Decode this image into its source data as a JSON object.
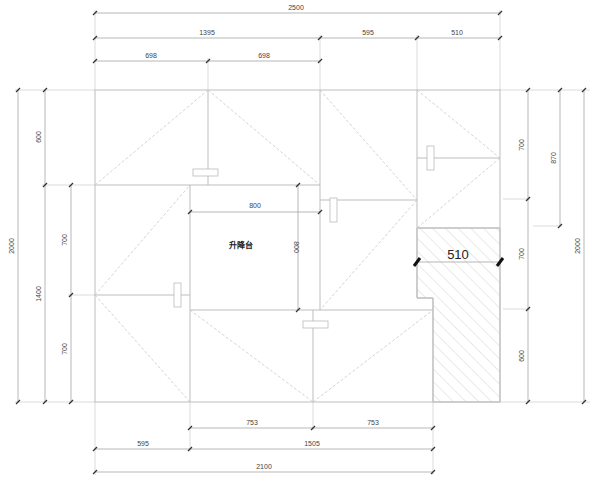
{
  "drawing": {
    "room_label": "升降台",
    "hatched_width_label": "510",
    "colors": {
      "line": "#bdbdbd",
      "dimension": "#9a9a9a",
      "text": "#444444",
      "hatch": "#c8c8c8"
    }
  },
  "dimensions": {
    "top": {
      "overall": "2500",
      "row2": [
        "1395",
        "595",
        "510"
      ],
      "row3": [
        "698",
        "698"
      ]
    },
    "left": {
      "overall": "2000",
      "row2": [
        "600",
        "1400"
      ],
      "row3": [
        "700",
        "700"
      ]
    },
    "right": {
      "overall": "2000",
      "row1": [
        "700",
        "700",
        "600"
      ],
      "row2": [
        "870"
      ]
    },
    "bottom": {
      "row1": [
        "753",
        "753"
      ],
      "row2": [
        "595",
        "1505"
      ],
      "overall": "2100"
    },
    "inner": {
      "width": "800",
      "height": "800"
    }
  }
}
